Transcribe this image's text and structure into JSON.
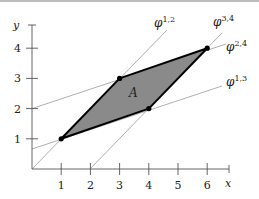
{
  "diagram": {
    "axes": {
      "x_label": "x",
      "y_label": "y",
      "x_ticks": [
        "1",
        "2",
        "3",
        "4",
        "5",
        "6"
      ],
      "y_ticks": [
        "1",
        "2",
        "3",
        "4"
      ]
    },
    "region": {
      "label": "A",
      "vertices": [
        [
          1,
          1
        ],
        [
          3,
          3
        ],
        [
          6,
          4
        ],
        [
          4,
          2
        ]
      ],
      "fill": "#8a8a8a",
      "stroke": "#000000"
    },
    "lines": [
      {
        "name": "phi-1-2",
        "base": "φ",
        "sup": "1,2",
        "equation": "y = x"
      },
      {
        "name": "phi-3-4",
        "base": "φ",
        "sup": "3,4",
        "equation": "y = x - 2"
      },
      {
        "name": "phi-2-4",
        "base": "φ",
        "sup": "2,4",
        "equation": "y = x/3 + 2"
      },
      {
        "name": "phi-1-3",
        "base": "φ",
        "sup": "1,3",
        "equation": "y = x/3 + 2/3"
      }
    ],
    "line_color": "#9a9a9a"
  }
}
